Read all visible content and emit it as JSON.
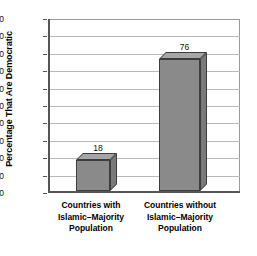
{
  "chart_data": {
    "type": "bar",
    "title": "",
    "xlabel": "",
    "ylabel": "Percentage That Are Democratic",
    "categories": [
      "Countries with\nIslamic–Majority\nPopulation",
      "Countries without\nIslamic–Majority\nPopulation"
    ],
    "category_lines": [
      [
        "Countries with",
        "Islamic–Majority",
        "Population"
      ],
      [
        "Countries without",
        "Islamic–Majority",
        "Population"
      ]
    ],
    "values": [
      18,
      76
    ],
    "value_labels": [
      "18",
      "76"
    ],
    "ylim": [
      0,
      100
    ],
    "ytick_step": 10,
    "yticks": [
      0,
      10,
      20,
      30,
      40,
      50,
      60,
      70,
      80,
      90,
      100
    ],
    "ytick_labels": [
      "0",
      "10",
      "20",
      "30",
      "40",
      "50",
      "60",
      "70",
      "80",
      "90",
      "100"
    ],
    "grid": true,
    "legend": false,
    "legend_position": "none",
    "style": "3d-bar",
    "colors": {
      "bar_front": "#8a8a8a",
      "bar_top": "#a6a6a6",
      "bar_side": "#7a7a7a",
      "bar_edge": "#3d3d3d",
      "grid": "#b9b9b9",
      "axis": "#555555",
      "background": "#ffffff",
      "text": "#000000"
    }
  }
}
